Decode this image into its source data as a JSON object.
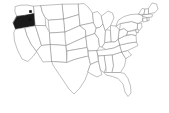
{
  "map": {
    "title": "United States blank state map",
    "region": "United States of America",
    "projection": "albers-usa",
    "background_color": "#ffffff",
    "state_fill_color": "#ffffff",
    "state_border_color": "#8c8c8c",
    "highlight_fill_color": "#1a1a1a",
    "marker_color": "#111111",
    "highlighted_states": [
      {
        "code": "OR",
        "name": "Oregon"
      }
    ],
    "markers": [
      {
        "id": "marker-1",
        "x": 30.5,
        "y": 11.5,
        "size": 2.6
      },
      {
        "id": "marker-2",
        "x": 30.0,
        "y": 19.5,
        "size": 2.4
      }
    ],
    "states": [
      {
        "code": "WA",
        "name": "Washington"
      },
      {
        "code": "OR",
        "name": "Oregon"
      },
      {
        "code": "CA",
        "name": "California"
      },
      {
        "code": "NV",
        "name": "Nevada"
      },
      {
        "code": "ID",
        "name": "Idaho"
      },
      {
        "code": "MT",
        "name": "Montana"
      },
      {
        "code": "WY",
        "name": "Wyoming"
      },
      {
        "code": "UT",
        "name": "Utah"
      },
      {
        "code": "AZ",
        "name": "Arizona"
      },
      {
        "code": "NM",
        "name": "New Mexico"
      },
      {
        "code": "CO",
        "name": "Colorado"
      },
      {
        "code": "ND",
        "name": "North Dakota"
      },
      {
        "code": "SD",
        "name": "South Dakota"
      },
      {
        "code": "NE",
        "name": "Nebraska"
      },
      {
        "code": "KS",
        "name": "Kansas"
      },
      {
        "code": "OK",
        "name": "Oklahoma"
      },
      {
        "code": "TX",
        "name": "Texas"
      },
      {
        "code": "MN",
        "name": "Minnesota"
      },
      {
        "code": "IA",
        "name": "Iowa"
      },
      {
        "code": "MO",
        "name": "Missouri"
      },
      {
        "code": "AR",
        "name": "Arkansas"
      },
      {
        "code": "LA",
        "name": "Louisiana"
      },
      {
        "code": "WI",
        "name": "Wisconsin"
      },
      {
        "code": "IL",
        "name": "Illinois"
      },
      {
        "code": "MI",
        "name": "Michigan"
      },
      {
        "code": "IN",
        "name": "Indiana"
      },
      {
        "code": "OH",
        "name": "Ohio"
      },
      {
        "code": "KY",
        "name": "Kentucky"
      },
      {
        "code": "TN",
        "name": "Tennessee"
      },
      {
        "code": "MS",
        "name": "Mississippi"
      },
      {
        "code": "AL",
        "name": "Alabama"
      },
      {
        "code": "GA",
        "name": "Georgia"
      },
      {
        "code": "FL",
        "name": "Florida"
      },
      {
        "code": "SC",
        "name": "South Carolina"
      },
      {
        "code": "NC",
        "name": "North Carolina"
      },
      {
        "code": "VA",
        "name": "Virginia"
      },
      {
        "code": "WV",
        "name": "West Virginia"
      },
      {
        "code": "MD",
        "name": "Maryland"
      },
      {
        "code": "DE",
        "name": "Delaware"
      },
      {
        "code": "PA",
        "name": "Pennsylvania"
      },
      {
        "code": "NJ",
        "name": "New Jersey"
      },
      {
        "code": "NY",
        "name": "New York"
      },
      {
        "code": "CT",
        "name": "Connecticut"
      },
      {
        "code": "RI",
        "name": "Rhode Island"
      },
      {
        "code": "MA",
        "name": "Massachusetts"
      },
      {
        "code": "VT",
        "name": "Vermont"
      },
      {
        "code": "NH",
        "name": "New Hampshire"
      },
      {
        "code": "ME",
        "name": "Maine"
      }
    ]
  }
}
